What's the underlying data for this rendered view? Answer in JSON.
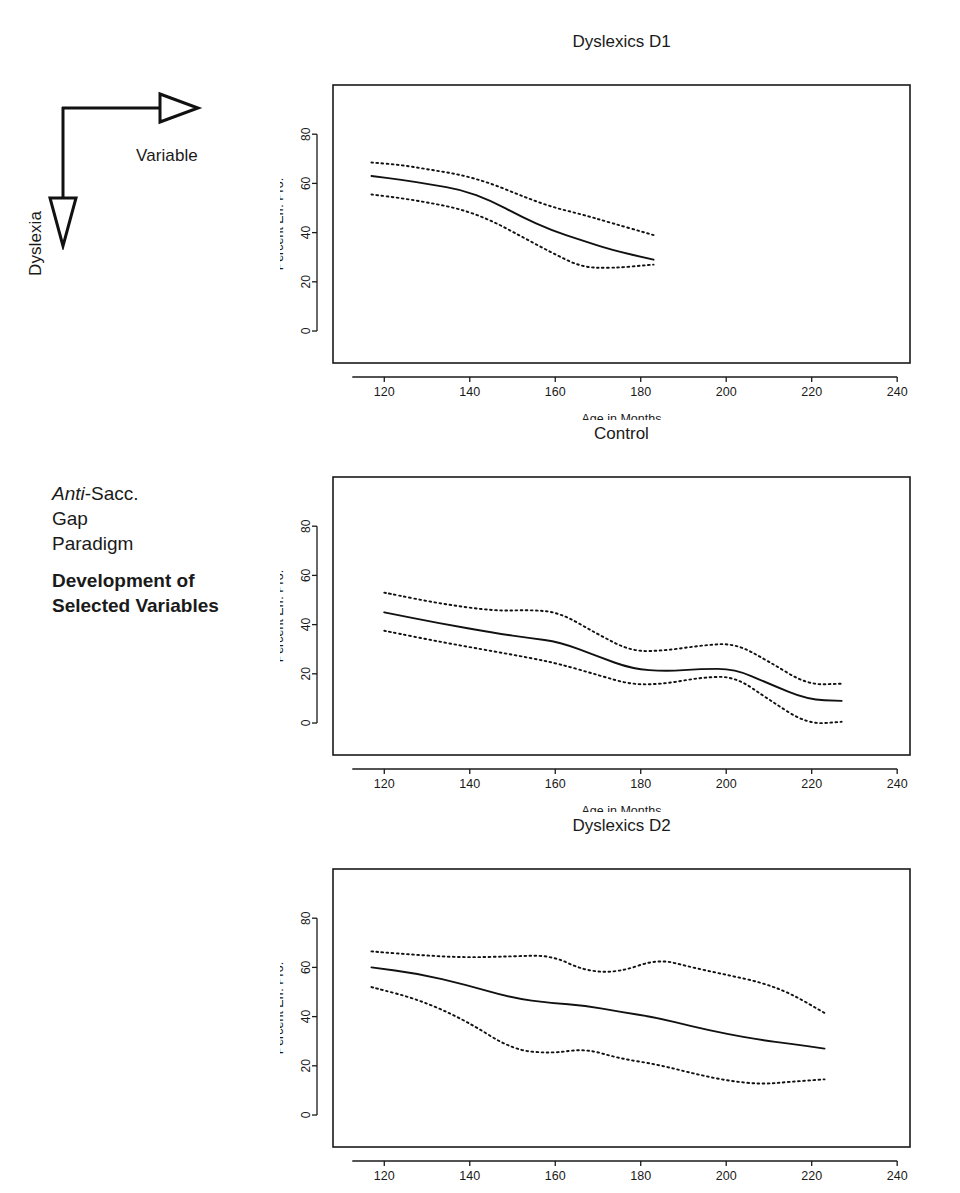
{
  "annotation": {
    "horizontal_axis_label": "Variable",
    "vertical_axis_label": "Dyslexia",
    "paradigm_line1_italic": "Anti",
    "paradigm_line1_rest": "-Sacc.",
    "paradigm_line2": "Gap",
    "paradigm_line3": "Paradigm",
    "subtitle_line1": "Development of",
    "subtitle_line2": "Selected Variables"
  },
  "chart_data": [
    {
      "type": "line",
      "title": "Dyslexics D1",
      "xlabel": "Age in Months",
      "ylabel": "Percent Err. Pro.",
      "xlim": [
        108,
        243
      ],
      "ylim": [
        -13,
        100
      ],
      "xticks": [
        120,
        140,
        160,
        180,
        200,
        220,
        240
      ],
      "yticks": [
        0,
        20,
        40,
        60,
        80
      ],
      "grid": false,
      "legend": "none",
      "x": [
        117,
        124,
        131,
        138,
        145,
        152,
        159,
        166,
        173,
        183
      ],
      "series": [
        {
          "name": "mean",
          "style": "solid",
          "values": [
            63.0,
            61.5,
            59.5,
            57.5,
            53.0,
            46.5,
            41.0,
            37.0,
            33.0,
            29.0
          ]
        },
        {
          "name": "upper",
          "style": "dotted",
          "values": [
            68.5,
            67.5,
            65.5,
            63.5,
            60.0,
            55.0,
            50.5,
            47.5,
            44.0,
            39.0
          ]
        },
        {
          "name": "lower",
          "style": "dotted",
          "values": [
            55.5,
            54.0,
            52.0,
            49.5,
            45.0,
            38.5,
            32.0,
            26.0,
            25.5,
            27.0
          ]
        }
      ]
    },
    {
      "type": "line",
      "title": "Control",
      "xlabel": "Age in Months",
      "ylabel": "Percent Err. Pro.",
      "xlim": [
        108,
        243
      ],
      "ylim": [
        -13,
        100
      ],
      "xticks": [
        120,
        140,
        160,
        180,
        200,
        220,
        240
      ],
      "yticks": [
        0,
        20,
        40,
        60,
        80
      ],
      "grid": false,
      "legend": "none",
      "x": [
        120,
        133,
        146,
        154,
        161,
        170,
        178,
        186,
        194,
        202,
        210,
        219,
        227
      ],
      "series": [
        {
          "name": "mean",
          "style": "solid",
          "values": [
            45.0,
            40.5,
            36.5,
            34.5,
            33.0,
            27.0,
            22.0,
            21.0,
            22.0,
            22.0,
            16.0,
            9.5,
            9.0
          ]
        },
        {
          "name": "upper",
          "style": "dotted",
          "values": [
            53.0,
            48.5,
            45.5,
            46.0,
            45.0,
            36.0,
            29.0,
            29.5,
            31.5,
            32.5,
            25.0,
            15.5,
            16.0
          ]
        },
        {
          "name": "lower",
          "style": "dotted",
          "values": [
            37.5,
            33.0,
            29.0,
            26.5,
            24.0,
            19.5,
            15.5,
            16.0,
            18.5,
            19.0,
            9.5,
            -0.5,
            0.5
          ]
        }
      ]
    },
    {
      "type": "line",
      "title": "Dyslexics D2",
      "xlabel": "",
      "ylabel": "Percent Err. Pro.",
      "xlim": [
        108,
        243
      ],
      "ylim": [
        -13,
        100
      ],
      "xticks": [
        120,
        140,
        160,
        180,
        200,
        220,
        240
      ],
      "yticks": [
        0,
        20,
        40,
        60,
        80
      ],
      "grid": false,
      "legend": "none",
      "x": [
        117,
        128,
        139,
        150,
        159,
        167,
        175,
        184,
        192,
        200,
        208,
        215,
        223
      ],
      "series": [
        {
          "name": "mean",
          "style": "solid",
          "values": [
            60.0,
            57.5,
            53.0,
            47.5,
            45.5,
            44.5,
            42.0,
            39.5,
            36.0,
            33.0,
            30.5,
            29.0,
            27.0
          ]
        },
        {
          "name": "upper",
          "style": "dotted",
          "values": [
            66.5,
            65.0,
            64.0,
            64.5,
            65.0,
            58.5,
            58.0,
            63.5,
            60.0,
            57.0,
            54.0,
            49.5,
            41.5
          ]
        },
        {
          "name": "lower",
          "style": "dotted",
          "values": [
            52.0,
            47.0,
            38.5,
            26.5,
            25.0,
            27.0,
            23.0,
            20.5,
            17.0,
            14.0,
            12.5,
            13.5,
            14.5
          ]
        }
      ]
    }
  ]
}
